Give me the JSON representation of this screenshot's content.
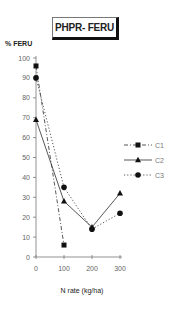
{
  "chart_data": {
    "type": "line",
    "title": "PHPR- FERU",
    "xlabel": "N rate (kg/ha)",
    "ylabel": "% FERU",
    "x": [
      0,
      100,
      200,
      300
    ],
    "x_ticks": [
      "0",
      "100",
      "200",
      "300"
    ],
    "y_ticks": [
      "0",
      "10",
      "20",
      "30",
      "40",
      "50",
      "60",
      "70",
      "80",
      "90",
      "100"
    ],
    "ylim": [
      0,
      100
    ],
    "xlim": [
      0,
      300
    ],
    "grid": false,
    "legend_position": "right",
    "series": [
      {
        "name": "C1",
        "marker": "square",
        "line": "dash-dot",
        "x": [
          0,
          100
        ],
        "values": [
          96,
          6
        ]
      },
      {
        "name": "C2",
        "marker": "triangle",
        "line": "solid",
        "x": [
          0,
          100,
          200,
          300
        ],
        "values": [
          69,
          28,
          15,
          32
        ]
      },
      {
        "name": "C3",
        "marker": "circle",
        "line": "dotted",
        "x": [
          0,
          100,
          200,
          300
        ],
        "values": [
          90,
          35,
          14,
          22
        ]
      }
    ]
  }
}
